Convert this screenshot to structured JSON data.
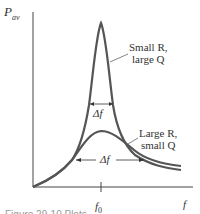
{
  "figure": {
    "y_axis_label": "P",
    "y_axis_label_sub": "av",
    "x_axis_label": "f",
    "x_tick_label": "f",
    "x_tick_label_sub": "0",
    "curves": [
      {
        "name": "sharp",
        "label_line1": "Small R,",
        "label_line2": "large Q",
        "bandwidth_label": "Δf"
      },
      {
        "name": "broad",
        "label_line1": "Large R,",
        "label_line2": "small Q",
        "bandwidth_label": "Δf"
      }
    ],
    "caption": "Figure 29-10  Plots"
  },
  "colors": {
    "curve": "#555555",
    "axis": "#444444",
    "text": "#333333"
  }
}
